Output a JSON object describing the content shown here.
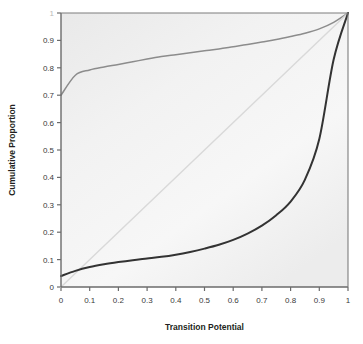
{
  "chart_data": {
    "type": "line",
    "title": "",
    "xlabel": "Transition Potential",
    "ylabel": "Cumulative Proportion",
    "xlim": [
      0,
      1
    ],
    "ylim": [
      0,
      1
    ],
    "grid": false,
    "legend": "none",
    "xticks": [
      "0",
      "0.1",
      "0.2",
      "0.3",
      "0.4",
      "0.5",
      "0.6",
      "0.7",
      "0.8",
      "0.9",
      "1"
    ],
    "xtick_values": [
      0,
      0.1,
      0.2,
      0.3,
      0.4,
      0.5,
      0.6,
      0.7,
      0.8,
      0.9,
      1
    ],
    "yticks": [
      "0",
      "0.1",
      "0.2",
      "0.3",
      "0.4",
      "0.5",
      "0.6",
      "0.7",
      "0.8",
      "0.9",
      "1"
    ],
    "ytick_values": [
      0,
      0.1,
      0.2,
      0.3,
      0.4,
      0.5,
      0.6,
      0.7,
      0.8,
      0.9,
      1
    ],
    "x": [
      0,
      0.05,
      0.1,
      0.15,
      0.2,
      0.25,
      0.3,
      0.35,
      0.4,
      0.45,
      0.5,
      0.55,
      0.6,
      0.65,
      0.7,
      0.75,
      0.8,
      0.85,
      0.9,
      0.95,
      1
    ],
    "series": [
      {
        "name": "upper-curve",
        "color": "#8c8c8c",
        "values": [
          0.7,
          0.773,
          0.792,
          0.803,
          0.812,
          0.822,
          0.832,
          0.841,
          0.848,
          0.855,
          0.862,
          0.869,
          0.877,
          0.885,
          0.894,
          0.903,
          0.914,
          0.926,
          0.942,
          0.966,
          1.0
        ]
      },
      {
        "name": "diagonal-reference",
        "color": "#d9d9d9",
        "values": [
          0.0,
          0.05,
          0.1,
          0.15,
          0.2,
          0.25,
          0.3,
          0.35,
          0.4,
          0.45,
          0.5,
          0.55,
          0.6,
          0.65,
          0.7,
          0.75,
          0.8,
          0.85,
          0.9,
          0.95,
          1.0
        ]
      },
      {
        "name": "lower-curve",
        "color": "#333333",
        "values": [
          0.04,
          0.059,
          0.073,
          0.083,
          0.091,
          0.098,
          0.104,
          0.11,
          0.118,
          0.128,
          0.14,
          0.154,
          0.172,
          0.195,
          0.224,
          0.262,
          0.312,
          0.392,
          0.54,
          0.83,
          1.0
        ]
      }
    ]
  },
  "axes": {
    "x_title": "Transition Potential",
    "y_title": "Cumulative Proportion"
  }
}
